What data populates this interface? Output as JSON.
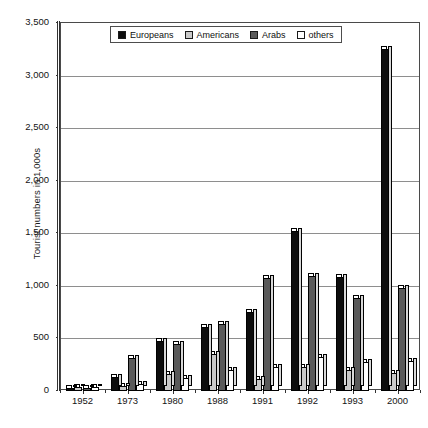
{
  "chart_data": {
    "type": "bar",
    "title": "",
    "xlabel": "",
    "ylabel": "Tourist numbers in 1,000s",
    "ylim": [
      0,
      3500
    ],
    "yticks": [
      "0",
      "500",
      "1,000",
      "1,500",
      "2,000",
      "2,500",
      "3,000",
      "3,500"
    ],
    "ytick_values": [
      0,
      500,
      1000,
      1500,
      2000,
      2500,
      3000,
      3500
    ],
    "grid": true,
    "legend_position": "top-center",
    "categories": [
      "1952",
      "1973",
      "1980",
      "1988",
      "1991",
      "1992",
      "1993",
      "2000"
    ],
    "series": [
      {
        "name": "Europeans",
        "color": "#0d0d0d",
        "values": [
          30,
          130,
          480,
          610,
          750,
          1520,
          1080,
          3250
        ]
      },
      {
        "name": "Americans",
        "color": "#c9c9c9",
        "values": [
          40,
          50,
          160,
          350,
          110,
          230,
          200,
          170
        ]
      },
      {
        "name": "Arabs",
        "color": "#5a5a5a",
        "values": [
          30,
          310,
          450,
          640,
          1070,
          1090,
          880,
          980
        ]
      },
      {
        "name": "others",
        "color": "#ffffff",
        "values": [
          40,
          70,
          120,
          200,
          230,
          320,
          280,
          290
        ]
      }
    ]
  }
}
